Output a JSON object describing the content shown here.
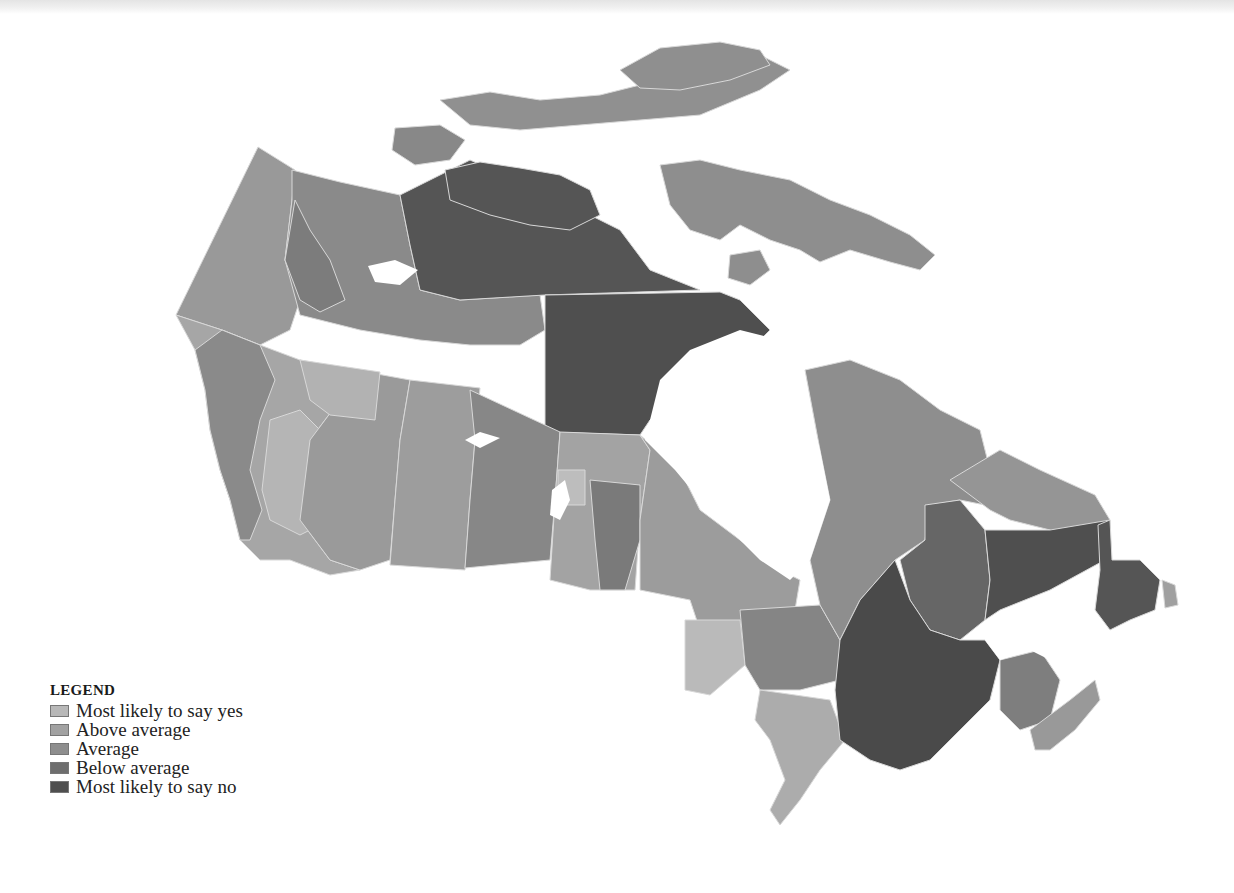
{
  "map": {
    "subject": "Canada",
    "legend": {
      "title": "LEGEND",
      "items": [
        {
          "label": "Most likely to say yes",
          "color": "#b8b8b8"
        },
        {
          "label": "Above average",
          "color": "#a2a2a2"
        },
        {
          "label": "Average",
          "color": "#8e8e8e"
        },
        {
          "label": "Below average",
          "color": "#6e6e6e"
        },
        {
          "label": "Most likely to say no",
          "color": "#4f4f4f"
        }
      ]
    },
    "colors": {
      "yes": "#b8b8b8",
      "above": "#a2a2a2",
      "average": "#8e8e8e",
      "below": "#6e6e6e",
      "no": "#4f4f4f",
      "water": "#ffffff",
      "border": "#d8d8d8"
    }
  }
}
